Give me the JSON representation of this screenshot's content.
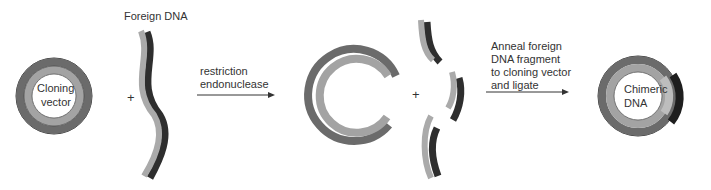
{
  "labels": {
    "foreign_dna": "Foreign DNA",
    "cloning_vector_line1": "Cloning",
    "cloning_vector_line2": "vector",
    "plus1": "+",
    "plus2": "+",
    "step1_line1": "restriction",
    "step1_line2": "endonuclease",
    "step2_line1": "Anneal foreign",
    "step2_line2": "DNA fragment",
    "step2_line3": "to cloning vector",
    "step2_line4": "and ligate",
    "chimeric_line1": "Chimeric",
    "chimeric_line2": "DNA"
  },
  "colors": {
    "vector_outer": "#6b6b6b",
    "vector_inner": "#a3a3a3",
    "foreign_light": "#aaaaaa",
    "foreign_dark": "#2e2e2e",
    "outline": "#444444"
  }
}
